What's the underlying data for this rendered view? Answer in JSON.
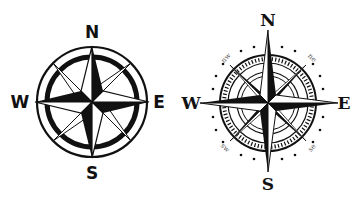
{
  "compass_left": {
    "style": "bold",
    "labels": {
      "n": "N",
      "e": "E",
      "s": "S",
      "w": "W"
    },
    "colors": {
      "ink": "#111111",
      "paper": "#ffffff"
    }
  },
  "compass_right": {
    "style": "nautical",
    "labels": {
      "n": "N",
      "e": "E",
      "s": "S",
      "w": "W",
      "nw": "nw",
      "ne": "ne",
      "sw": "sw",
      "se": "se"
    },
    "colors": {
      "ink": "#111111",
      "paper": "#ffffff",
      "inter_label": "#555555"
    }
  }
}
